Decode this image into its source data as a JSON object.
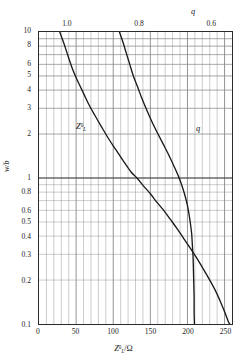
{
  "chart_data": {
    "type": "line",
    "title": "",
    "subtitle": "",
    "xlabel": "Z°L/Ω",
    "ylabel": "w/b",
    "top_axis_label": "q",
    "grid": true,
    "legend_position": "inline-annotation",
    "yscale": "log",
    "xscale": "linear",
    "xlim": [
      0,
      260
    ],
    "ylim": [
      0.1,
      10
    ],
    "top_axis": {
      "label": "q",
      "reversed": true,
      "range": [
        1.08,
        0.54
      ],
      "ticks": [
        {
          "value": 1.0,
          "label": "1.0"
        },
        {
          "value": 0.8,
          "label": "0.8"
        },
        {
          "value": 0.6,
          "label": "0.6"
        }
      ]
    },
    "xticks": [
      {
        "value": 0,
        "label": "0"
      },
      {
        "value": 50,
        "label": "50"
      },
      {
        "value": 100,
        "label": "100"
      },
      {
        "value": 150,
        "label": "150"
      },
      {
        "value": 200,
        "label": "200"
      },
      {
        "value": 250,
        "label": "250"
      }
    ],
    "yticks": [
      {
        "value": 10,
        "label": "10"
      },
      {
        "value": 8,
        "label": "8"
      },
      {
        "value": 6,
        "label": "6"
      },
      {
        "value": 5,
        "label": "5"
      },
      {
        "value": 4,
        "label": "4"
      },
      {
        "value": 3,
        "label": "3"
      },
      {
        "value": 2,
        "label": "2"
      },
      {
        "value": 1,
        "label": "1"
      },
      {
        "value": 0.8,
        "label": "0.8"
      },
      {
        "value": 0.6,
        "label": "0.6"
      },
      {
        "value": 0.5,
        "label": "0.5"
      },
      {
        "value": 0.4,
        "label": "0.4"
      },
      {
        "value": 0.3,
        "label": "0.3"
      },
      {
        "value": 0.2,
        "label": "0.2"
      },
      {
        "value": 0.1,
        "label": "0.1"
      }
    ],
    "series": [
      {
        "name": "Z°L",
        "annotation": "Z°L",
        "axis": "bottom",
        "color": "#1a1a1a",
        "points": [
          {
            "x": 28,
            "y": 10.0
          },
          {
            "x": 33,
            "y": 8.5
          },
          {
            "x": 37,
            "y": 7.4
          },
          {
            "x": 41,
            "y": 6.4
          },
          {
            "x": 45,
            "y": 5.6
          },
          {
            "x": 49,
            "y": 5.0
          },
          {
            "x": 54,
            "y": 4.4
          },
          {
            "x": 60,
            "y": 3.8
          },
          {
            "x": 67,
            "y": 3.2
          },
          {
            "x": 75,
            "y": 2.7
          },
          {
            "x": 84,
            "y": 2.25
          },
          {
            "x": 94,
            "y": 1.85
          },
          {
            "x": 104,
            "y": 1.55
          },
          {
            "x": 114,
            "y": 1.3
          },
          {
            "x": 124,
            "y": 1.1
          },
          {
            "x": 132,
            "y": 1.0
          },
          {
            "x": 141,
            "y": 0.88
          },
          {
            "x": 150,
            "y": 0.78
          },
          {
            "x": 159,
            "y": 0.68
          },
          {
            "x": 168,
            "y": 0.6
          },
          {
            "x": 177,
            "y": 0.52
          },
          {
            "x": 186,
            "y": 0.45
          },
          {
            "x": 195,
            "y": 0.385
          },
          {
            "x": 204,
            "y": 0.33
          },
          {
            "x": 213,
            "y": 0.28
          },
          {
            "x": 222,
            "y": 0.235
          },
          {
            "x": 230,
            "y": 0.2
          },
          {
            "x": 238,
            "y": 0.168
          },
          {
            "x": 245,
            "y": 0.14
          },
          {
            "x": 251,
            "y": 0.118
          },
          {
            "x": 255,
            "y": 0.104
          },
          {
            "x": 257,
            "y": 0.1
          }
        ]
      },
      {
        "name": "q",
        "annotation": "q",
        "axis": "top",
        "color": "#1a1a1a",
        "points": [
          {
            "q": 0.855,
            "y": 10.0
          },
          {
            "q": 0.845,
            "y": 8.5
          },
          {
            "q": 0.836,
            "y": 7.2
          },
          {
            "q": 0.826,
            "y": 6.0
          },
          {
            "q": 0.816,
            "y": 5.0
          },
          {
            "q": 0.804,
            "y": 4.2
          },
          {
            "q": 0.792,
            "y": 3.5
          },
          {
            "q": 0.778,
            "y": 2.9
          },
          {
            "q": 0.763,
            "y": 2.4
          },
          {
            "q": 0.747,
            "y": 2.0
          },
          {
            "q": 0.731,
            "y": 1.68
          },
          {
            "q": 0.716,
            "y": 1.42
          },
          {
            "q": 0.702,
            "y": 1.2
          },
          {
            "q": 0.69,
            "y": 1.03
          },
          {
            "q": 0.681,
            "y": 0.9
          },
          {
            "q": 0.673,
            "y": 0.78
          },
          {
            "q": 0.666,
            "y": 0.67
          },
          {
            "q": 0.661,
            "y": 0.58
          },
          {
            "q": 0.657,
            "y": 0.5
          },
          {
            "q": 0.653,
            "y": 0.42
          },
          {
            "q": 0.651,
            "y": 0.35
          },
          {
            "q": 0.649,
            "y": 0.29
          },
          {
            "q": 0.648,
            "y": 0.24
          },
          {
            "q": 0.647,
            "y": 0.19
          },
          {
            "q": 0.646,
            "y": 0.15
          },
          {
            "q": 0.646,
            "y": 0.12
          },
          {
            "q": 0.645,
            "y": 0.1
          }
        ]
      }
    ]
  },
  "axes": {
    "y_title": "w/b",
    "x_title_pre": "Z",
    "x_title_sup": "0",
    "x_title_sub": "L",
    "x_title_post": "/Ω",
    "q_title": "q"
  },
  "annotations": {
    "z_tag_pre": "Z",
    "z_tag_sup": "0",
    "z_tag_sub": "L",
    "q_tag": "q"
  }
}
